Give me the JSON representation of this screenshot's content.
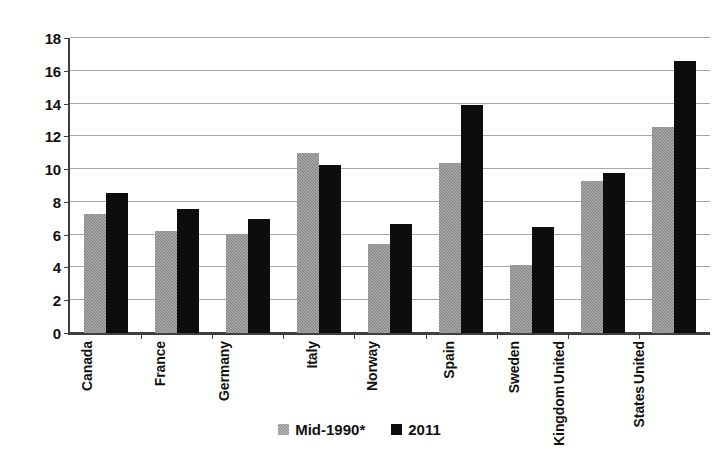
{
  "chart_data": {
    "type": "bar",
    "title": "",
    "subtitle": "",
    "xlabel": "",
    "ylabel": "",
    "ylim": [
      0,
      18
    ],
    "ytick_step": 2,
    "yticks": [
      "18",
      "16",
      "14",
      "12",
      "10",
      "8",
      "6",
      "4",
      "2",
      "0"
    ],
    "grid": true,
    "legend_position": "bottom",
    "categories": [
      "Canada",
      "France",
      "Germany",
      "Italy",
      "Norway",
      "Spain",
      "Sweden",
      "United Kingdom",
      "United States"
    ],
    "category_lines": [
      [
        "Canada"
      ],
      [
        "France"
      ],
      [
        "Germany"
      ],
      [
        "Italy"
      ],
      [
        "Norway"
      ],
      [
        "Spain"
      ],
      [
        "Sweden"
      ],
      [
        "United",
        "Kingdom"
      ],
      [
        "United",
        "States"
      ]
    ],
    "series": [
      {
        "name": "Mid-1990*",
        "color": "#808080",
        "values": [
          7.2,
          6.2,
          6.0,
          10.9,
          5.4,
          10.3,
          4.1,
          9.2,
          12.5
        ]
      },
      {
        "name": "2011",
        "color": "#0d0d0d",
        "values": [
          8.5,
          7.5,
          6.9,
          10.2,
          6.6,
          13.8,
          6.4,
          9.7,
          16.5
        ]
      }
    ]
  },
  "legend": {
    "items": [
      {
        "label": "Mid-1990*",
        "swatch": "gray-square-icon"
      },
      {
        "label": "2011",
        "swatch": "black-square-icon"
      }
    ]
  }
}
